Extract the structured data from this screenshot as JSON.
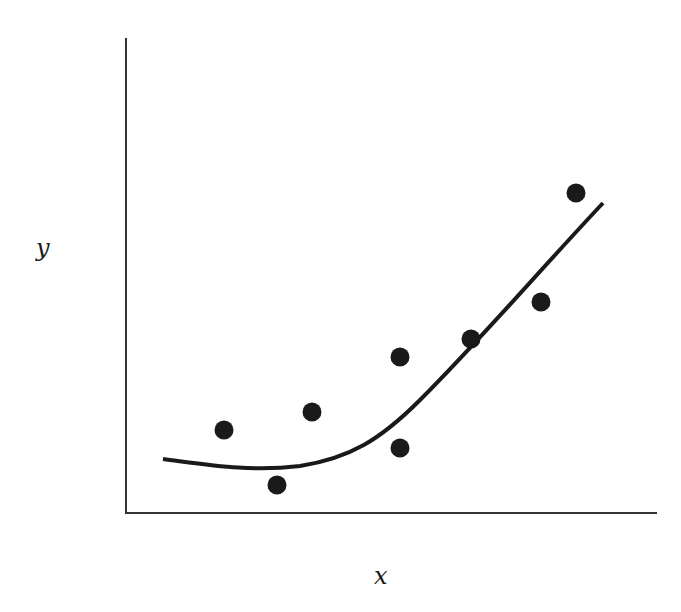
{
  "chart_data": {
    "type": "scatter",
    "title": "",
    "xlabel": "x",
    "ylabel": "y",
    "grid": false,
    "legend": null,
    "ticks": "none",
    "points": [
      {
        "x": 224,
        "y": 430
      },
      {
        "x": 277,
        "y": 485
      },
      {
        "x": 312,
        "y": 412
      },
      {
        "x": 400,
        "y": 357
      },
      {
        "x": 400,
        "y": 448
      },
      {
        "x": 471,
        "y": 339
      },
      {
        "x": 541,
        "y": 302
      },
      {
        "x": 576,
        "y": 193
      }
    ],
    "fitted_curve": {
      "description": "smooth nonlinear (quadratic-like) fit",
      "path": "M163,459 C210,465 250,472 300,466 C350,458 380,440 420,400 C480,340 540,270 603,203"
    },
    "colors": {
      "points": "#1a1a1a",
      "curve": "#1a1a1a",
      "axes": "#333333"
    }
  }
}
